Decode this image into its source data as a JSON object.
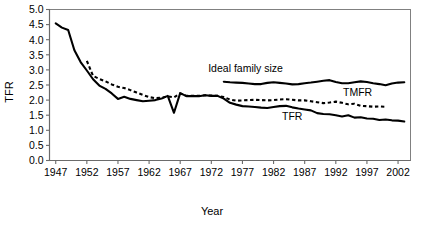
{
  "chart_data": {
    "type": "line",
    "title": "",
    "xlabel": "Year",
    "ylabel": "TFR",
    "xlim": [
      1946,
      2004
    ],
    "ylim": [
      0.0,
      5.0
    ],
    "grid": false,
    "legend": "inline-annotations",
    "x_tick_labels": [
      "1947",
      "1952",
      "1957",
      "1962",
      "1967",
      "1972",
      "1977",
      "1982",
      "1987",
      "1992",
      "1997",
      "2002"
    ],
    "x_ticks": [
      1947,
      1952,
      1957,
      1962,
      1967,
      1972,
      1977,
      1982,
      1987,
      1992,
      1997,
      2002
    ],
    "y_tick_labels": [
      "0.0",
      "0.5",
      "1.0",
      "1.5",
      "2.0",
      "2.5",
      "3.0",
      "3.5",
      "4.0",
      "4.5",
      "5.0"
    ],
    "y_ticks": [
      0.0,
      0.5,
      1.0,
      1.5,
      2.0,
      2.5,
      3.0,
      3.5,
      4.0,
      4.5,
      5.0
    ],
    "annotations": [
      {
        "name": "ideal-family-size-label",
        "text": "Ideal family size",
        "x": 1977.5,
        "y": 2.92
      },
      {
        "name": "tmfr-label",
        "text": "TMFR",
        "x": 1995.5,
        "y": 2.12
      },
      {
        "name": "tfr-label",
        "text": "TFR",
        "x": 1985.0,
        "y": 1.35
      }
    ],
    "series": [
      {
        "name": "TFR",
        "style": "solid",
        "x": [
          1947,
          1948,
          1949,
          1950,
          1951,
          1952,
          1953,
          1954,
          1955,
          1956,
          1957,
          1958,
          1959,
          1960,
          1961,
          1962,
          1963,
          1964,
          1965,
          1966,
          1967,
          1968,
          1969,
          1970,
          1971,
          1972,
          1973,
          1974,
          1975,
          1976,
          1977,
          1978,
          1979,
          1980,
          1981,
          1982,
          1983,
          1984,
          1985,
          1986,
          1987,
          1988,
          1989,
          1990,
          1991,
          1992,
          1993,
          1994,
          1995,
          1996,
          1997,
          1998,
          1999,
          2000,
          2001,
          2002,
          2003
        ],
        "values": [
          4.54,
          4.4,
          4.32,
          3.65,
          3.26,
          2.98,
          2.69,
          2.48,
          2.37,
          2.22,
          2.04,
          2.11,
          2.04,
          2.0,
          1.96,
          1.98,
          2.0,
          2.05,
          2.14,
          1.58,
          2.23,
          2.13,
          2.13,
          2.13,
          2.16,
          2.14,
          2.14,
          2.05,
          1.91,
          1.85,
          1.8,
          1.79,
          1.77,
          1.75,
          1.74,
          1.77,
          1.8,
          1.81,
          1.76,
          1.72,
          1.69,
          1.66,
          1.57,
          1.54,
          1.53,
          1.5,
          1.46,
          1.5,
          1.42,
          1.43,
          1.39,
          1.38,
          1.34,
          1.36,
          1.33,
          1.32,
          1.29
        ]
      },
      {
        "name": "TMFR",
        "style": "dashed",
        "x": [
          1952,
          1953,
          1954,
          1955,
          1956,
          1957,
          1958,
          1959,
          1960,
          1961,
          1962,
          1963,
          1964,
          1965,
          1966,
          1967,
          1968,
          1969,
          1970,
          1971,
          1972,
          1973,
          1974,
          1975,
          1976,
          1977,
          1978,
          1979,
          1980,
          1981,
          1982,
          1983,
          1984,
          1985,
          1986,
          1987,
          1988,
          1989,
          1990,
          1991,
          1992,
          1993,
          1994,
          1995,
          1996,
          1997,
          1998,
          1999,
          2000
        ],
        "values": [
          3.3,
          2.8,
          2.7,
          2.62,
          2.52,
          2.44,
          2.4,
          2.33,
          2.25,
          2.17,
          2.1,
          2.06,
          2.08,
          2.12,
          2.09,
          2.22,
          2.14,
          2.14,
          2.14,
          2.16,
          2.15,
          2.14,
          2.1,
          2.02,
          1.98,
          1.99,
          2.0,
          2.01,
          2.0,
          1.99,
          2.0,
          2.02,
          2.03,
          2.01,
          1.99,
          1.99,
          1.96,
          1.93,
          1.9,
          1.92,
          1.95,
          1.91,
          1.86,
          1.88,
          1.81,
          1.8,
          1.78,
          1.79,
          1.78
        ]
      },
      {
        "name": "Ideal family size",
        "style": "solid",
        "x": [
          1974,
          1975,
          1976,
          1977,
          1978,
          1979,
          1980,
          1981,
          1982,
          1983,
          1984,
          1985,
          1986,
          1987,
          1988,
          1989,
          1990,
          1991,
          1992,
          1993,
          1994,
          1995,
          1996,
          1997,
          1998,
          1999,
          2000,
          2001,
          2002,
          2003
        ],
        "values": [
          2.61,
          2.59,
          2.58,
          2.57,
          2.55,
          2.53,
          2.53,
          2.57,
          2.59,
          2.57,
          2.55,
          2.52,
          2.53,
          2.56,
          2.58,
          2.61,
          2.64,
          2.66,
          2.6,
          2.56,
          2.56,
          2.59,
          2.62,
          2.6,
          2.56,
          2.53,
          2.49,
          2.55,
          2.58,
          2.59
        ]
      }
    ]
  }
}
